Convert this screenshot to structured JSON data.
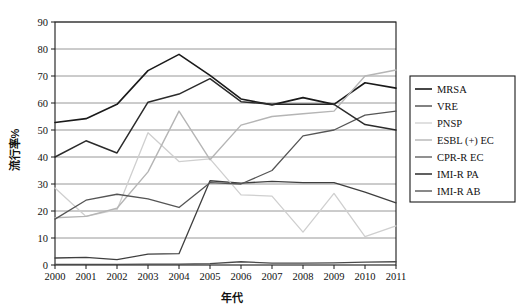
{
  "chart_data": {
    "type": "line",
    "title": "",
    "xlabel": "年代",
    "ylabel": "流行率%",
    "x": [
      2000,
      2001,
      2002,
      2003,
      2004,
      2005,
      2006,
      2007,
      2008,
      2009,
      2010,
      2011
    ],
    "categories": [
      "2000",
      "2001",
      "2002",
      "2003",
      "2004",
      "2005",
      "2006",
      "2007",
      "2008",
      "2009",
      "2010",
      "2011"
    ],
    "xlim": [
      2000,
      2011
    ],
    "ylim": [
      0,
      90
    ],
    "yticks": [
      0,
      10,
      20,
      30,
      40,
      50,
      60,
      70,
      80,
      90
    ],
    "grid": "horizontal",
    "legend_position": "right",
    "series": [
      {
        "name": "MRSA",
        "color": "#1a1a1a",
        "width": 1.6,
        "values": [
          52.8,
          54.2,
          59.5,
          72.0,
          78.0,
          70.2,
          61.5,
          59.3,
          62.0,
          59.5,
          67.5,
          65.5
        ]
      },
      {
        "name": "VRE",
        "color": "#3f3f3f",
        "width": 1.3,
        "values": [
          2.6,
          2.8,
          2.0,
          4.0,
          4.2,
          31.2,
          30.3,
          31.0,
          30.5,
          30.5,
          27.0,
          23.0
        ]
      },
      {
        "name": "PNSP",
        "color": "#cfcfcf",
        "width": 1.3,
        "values": [
          28.5,
          18.0,
          20.5,
          49.0,
          38.3,
          39.3,
          26.0,
          25.5,
          12.2,
          26.5,
          10.5,
          14.5
        ]
      },
      {
        "name": "ESBL (+) EC",
        "color": "#b5b5b5",
        "width": 1.4,
        "values": [
          17.5,
          18.0,
          21.0,
          34.5,
          57.0,
          39.0,
          51.8,
          55.0,
          56.0,
          57.0,
          70.0,
          72.2
        ]
      },
      {
        "name": "CPR-R EC",
        "color": "#555555",
        "width": 1.3,
        "values": [
          17.0,
          24.0,
          26.2,
          24.5,
          21.3,
          30.5,
          30.0,
          35.0,
          47.8,
          50.0,
          55.5,
          57.0
        ]
      },
      {
        "name": "IMI-R PA",
        "color": "#2b2b2b",
        "width": 1.5,
        "values": [
          40.0,
          46.0,
          41.5,
          60.3,
          63.3,
          69.0,
          60.5,
          59.5,
          59.5,
          59.5,
          52.0,
          50.0
        ]
      },
      {
        "name": "IMI-R AB",
        "color": "#4a4a4a",
        "width": 1.3,
        "values": [
          0.2,
          0.2,
          0.2,
          0.3,
          0.3,
          0.5,
          1.2,
          0.7,
          0.7,
          0.8,
          1.1,
          1.2
        ]
      }
    ]
  },
  "legend": {
    "items": [
      {
        "label": "MRSA"
      },
      {
        "label": "VRE"
      },
      {
        "label": "PNSP"
      },
      {
        "label": "ESBL (+) EC"
      },
      {
        "label": "CPR-R EC"
      },
      {
        "label": "IMI-R PA"
      },
      {
        "label": "IMI-R AB"
      }
    ]
  },
  "axes": {
    "y_title": "流行率%",
    "x_title": "年代"
  }
}
